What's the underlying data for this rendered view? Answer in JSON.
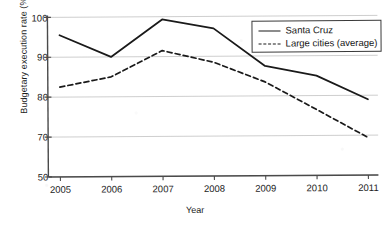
{
  "chart_data": {
    "type": "line",
    "title": "",
    "xlabel": "Year",
    "ylabel": "Budgetary execution rate (%)",
    "categories": [
      "2005",
      "2006",
      "2007",
      "2008",
      "2009",
      "2010",
      "2011"
    ],
    "x_tick_labels": [
      "2005",
      "2006",
      "2007",
      "2008",
      "2009",
      "2010",
      "2011"
    ],
    "y_tick_labels": [
      "100",
      "90",
      "80",
      "70",
      "50"
    ],
    "y_tick_values": [
      100,
      90,
      80,
      70,
      50
    ],
    "ylim": [
      50,
      100
    ],
    "grid": "horizontal",
    "legend_position": "top-right",
    "axis_note": "y-axis ticks are evenly spaced in pixels: 100, 90, 80, 70, 50",
    "series": [
      {
        "name": "Santa Cruz",
        "style": "solid",
        "color": "#1a1a1a",
        "values": [
          95.5,
          90.0,
          99.3,
          97.0,
          87.5,
          85.0,
          79.0
        ]
      },
      {
        "name": "Large cities (average)",
        "style": "dashed",
        "color": "#1a1a1a",
        "values": [
          82.5,
          85.0,
          91.5,
          88.5,
          83.5,
          76.5,
          68.8
        ]
      }
    ]
  },
  "legend": {
    "items": [
      {
        "label": "Santa Cruz",
        "style": "solid"
      },
      {
        "label": "Large cities (average)",
        "style": "dashed"
      }
    ]
  },
  "axes": {
    "y_title": "Budgetary execution rate (%)",
    "x_title": "Year"
  },
  "colors": {
    "line": "#1a1a1a",
    "grid": "#c9c9c9",
    "axis": "#4a4a4a",
    "background": "#ffffff"
  }
}
